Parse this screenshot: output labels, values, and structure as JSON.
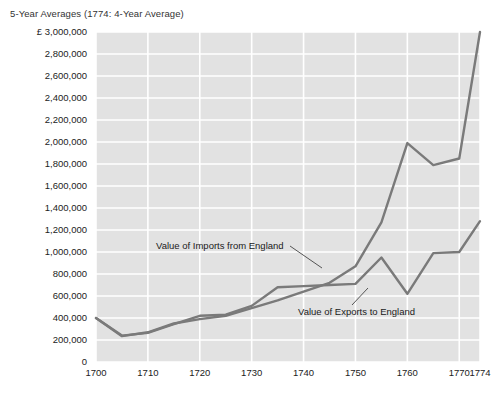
{
  "chart_data": {
    "type": "line",
    "title": "5-Year Averages (1774: 4-Year Average)",
    "xlabel": "",
    "ylabel": "",
    "currency_symbol": "£",
    "xlim": [
      1700,
      1774
    ],
    "ylim": [
      0,
      3000000
    ],
    "grid": true,
    "legend_position": "inline-annotations",
    "plot_background": "#e2e2e2",
    "gridline_color": "#ffffff",
    "line_color": "#7a7a7a",
    "x": [
      1700,
      1705,
      1710,
      1715,
      1720,
      1725,
      1730,
      1735,
      1740,
      1745,
      1750,
      1755,
      1760,
      1765,
      1770,
      1774
    ],
    "y_tick_labels": [
      "£ 3,000,000",
      "2,800,000",
      "2,600,000",
      "2,400,000",
      "2,200,000",
      "2,000,000",
      "1,800,000",
      "1,600,000",
      "1,400,000",
      "1,200,000",
      "1,000,000",
      "800,000",
      "600,000",
      "400,000",
      "200,000",
      "0"
    ],
    "y_tick_values": [
      3000000,
      2800000,
      2600000,
      2400000,
      2200000,
      2000000,
      1800000,
      1600000,
      1400000,
      1200000,
      1000000,
      800000,
      600000,
      400000,
      200000,
      0
    ],
    "x_tick_labels": [
      "1700",
      "1710",
      "1720",
      "1730",
      "1740",
      "1750",
      "1760",
      "1770",
      "1774"
    ],
    "x_tick_values": [
      1700,
      1710,
      1720,
      1730,
      1740,
      1750,
      1760,
      1770,
      1774
    ],
    "series": [
      {
        "name": "Value of Imports from England",
        "values": [
          400000,
          235000,
          270000,
          350000,
          390000,
          420000,
          490000,
          560000,
          640000,
          720000,
          870000,
          1270000,
          1990000,
          1790000,
          1850000,
          3000000
        ],
        "annotation": {
          "text": "Value of Imports from England",
          "text_x": 156,
          "text_y": 249,
          "leader": [
            [
              290,
              246
            ],
            [
              322,
              268
            ]
          ]
        }
      },
      {
        "name": "Value of Exports to England",
        "values": [
          400000,
          240000,
          265000,
          345000,
          420000,
          430000,
          510000,
          680000,
          690000,
          700000,
          710000,
          950000,
          620000,
          990000,
          1000000,
          1280000
        ],
        "annotation": {
          "text": "Value of Exports to England",
          "text_x": 298,
          "text_y": 315,
          "leader": [
            [
              352,
              305
            ],
            [
              368,
              288
            ]
          ]
        }
      }
    ]
  }
}
